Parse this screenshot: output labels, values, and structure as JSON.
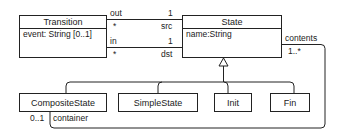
{
  "classes": {
    "transition": {
      "name": "Transition",
      "attribute": "event: String [0..1]"
    },
    "state": {
      "name": "State",
      "attribute": "name:String"
    },
    "composite_state": {
      "name": "CompositeState"
    },
    "simple_state": {
      "name": "SimpleState"
    },
    "init": {
      "name": "Init"
    },
    "fin": {
      "name": "Fin"
    }
  },
  "associations": {
    "out": {
      "role_left": "out",
      "mult_left": "*",
      "mult_right": "1",
      "role_right": "src"
    },
    "in": {
      "role_left": "in",
      "mult_left": "*",
      "mult_right": "1",
      "role_right": "dst"
    },
    "contents": {
      "role": "contents",
      "mult": "1..*"
    },
    "container": {
      "mult": "0..1",
      "role": "container"
    }
  },
  "colors": {
    "line": "#222222",
    "background": "#ffffff"
  }
}
